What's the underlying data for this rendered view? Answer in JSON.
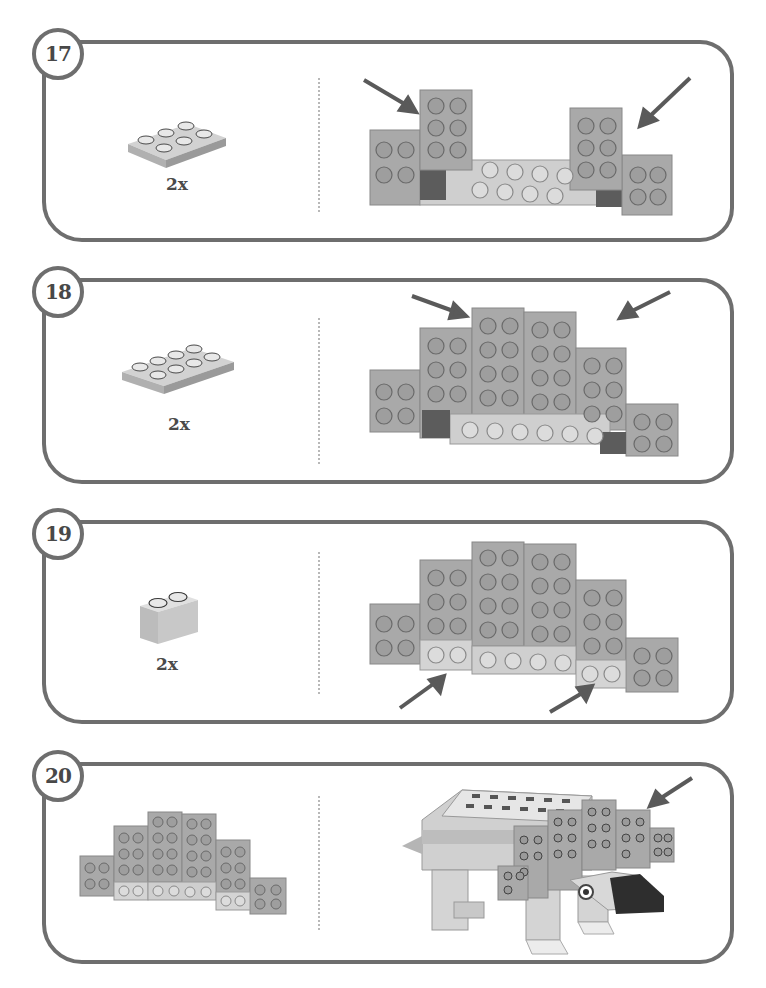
{
  "page": {
    "type": "LEGO building instructions",
    "steps": [
      {
        "number": "17",
        "part": "2x3 plate",
        "quantity": "2x",
        "result": "two 2x3 plates added upright on top, arrows pointing to them"
      },
      {
        "number": "18",
        "part": "2x4 plate",
        "quantity": "2x",
        "result": "two 2x4 plates added in the center raising the spine, arrows pointing to them"
      },
      {
        "number": "19",
        "part": "1x2 brick",
        "quantity": "2x",
        "result": "two 1x2 bricks added under the plates at bottom, arrows pointing to them"
      },
      {
        "number": "20",
        "part": "assembled spine wall",
        "quantity": "",
        "result": "spine wall attached to the dinosaur body, arrow pointing to it"
      }
    ]
  },
  "colors": {
    "border": "#6e6e6e",
    "brick": "#a9a9a9",
    "brick_light": "#cfcfcf",
    "brick_dark": "#5c5c5c",
    "arrow": "#5a5a5a"
  }
}
